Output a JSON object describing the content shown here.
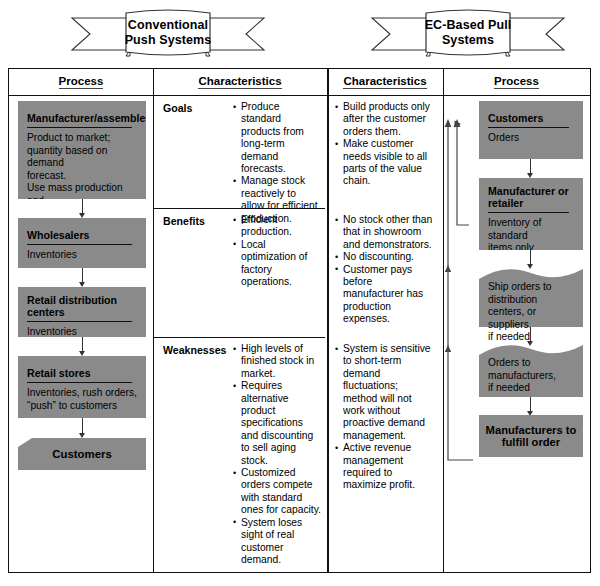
{
  "banners": [
    {
      "name": "conventional-push",
      "line1": "Conventional",
      "line2": "Push Systems"
    },
    {
      "name": "ec-based-pull",
      "line1": "EC-Based Pull",
      "line2": "Systems"
    }
  ],
  "column_headers": [
    {
      "label": "Process"
    },
    {
      "label": "Characteristics"
    },
    {
      "label": "Characteristics"
    },
    {
      "label": "Process"
    }
  ],
  "left_process": {
    "steps": [
      {
        "title": "Manufacturer/assembler",
        "body": "Product to market;\nquantity based on demand\nforecast.\nUse mass production and\ninventories."
      },
      {
        "title": "Wholesalers",
        "body": "Inventories"
      },
      {
        "title": "Retail distribution centers",
        "body": "Inventories"
      },
      {
        "title": "Retail stores",
        "body": "Inventories, rush orders,\n“push” to customers"
      }
    ],
    "terminal": "Customers"
  },
  "right_process": {
    "steps": [
      {
        "title": "Customers",
        "body": "Orders",
        "shape": "box"
      },
      {
        "title": "Manufacturer or retailer",
        "body": "Inventory of standard\nitems only",
        "shape": "box"
      },
      {
        "title": "",
        "body": "Ship orders to distribution\ncenters, or suppliers,\nif needed",
        "shape": "wavy"
      },
      {
        "title": "",
        "body": "Orders to manufacturers,\nif needed",
        "shape": "wavy"
      },
      {
        "title": "Manufacturers to\nfulfill order",
        "body": "",
        "shape": "centered"
      }
    ]
  },
  "push_characteristics": [
    {
      "label": "Goals",
      "items": [
        "Produce standard products from long-term demand forecasts.",
        "Manage stock reactively to allow for efficient production."
      ]
    },
    {
      "label": "Benefits",
      "items": [
        "Efficient production.",
        "Local optimization of factory operations."
      ]
    },
    {
      "label": "Weaknesses",
      "items": [
        "High levels of finished stock in market.",
        "Requires alternative product specifications and discounting to sell aging stock.",
        "Customized orders compete with standard ones for capacity.",
        "System loses sight of real customer demand."
      ]
    }
  ],
  "pull_characteristics": [
    {
      "label": "Goals",
      "items": [
        "Build products only after the customer orders them.",
        "Make customer needs visible to all parts of the value chain."
      ]
    },
    {
      "label": "Benefits",
      "items": [
        "No stock other than that in showroom and demonstrators.",
        "No discounting.",
        "Customer pays before manufacturer has production expenses."
      ]
    },
    {
      "label": "Weaknesses",
      "items": [
        "System is sensitive to short-term demand fluctuations; method will not work without proactive demand management.",
        "Active revenue management required to maximize profit."
      ]
    }
  ],
  "colors": {
    "box_fill": "#8a8a8a",
    "frame_line": "#111111",
    "background": "#ffffff"
  }
}
